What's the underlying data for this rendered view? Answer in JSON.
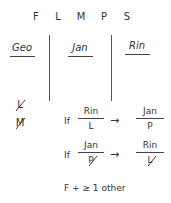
{
  "entities": [
    "F",
    "L",
    "M",
    "P",
    "S"
  ],
  "columns": [
    {
      "label": "Geo"
    },
    {
      "label": "Jan"
    },
    {
      "label": "Rin"
    }
  ],
  "geo_excluded": [
    "L",
    "M"
  ],
  "rules": [
    {
      "prefix": "If",
      "condition": {
        "top": "Rin",
        "bottom": "L",
        "negated": false
      },
      "arrow": "→",
      "result": {
        "top": "Jan",
        "bottom": "P",
        "negated": false
      }
    },
    {
      "prefix": "If",
      "condition": {
        "top": "Jan",
        "bottom": "P",
        "negated": true
      },
      "arrow": "→",
      "result": {
        "top": "Rin",
        "bottom": "L",
        "negated": true
      }
    }
  ],
  "note": "F + ≥ 1 other"
}
